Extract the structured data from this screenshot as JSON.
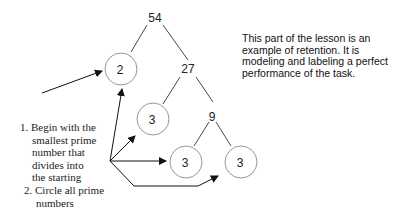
{
  "tree": {
    "root": "54",
    "nodes": [
      {
        "id": "n54",
        "label": "54",
        "circled": false
      },
      {
        "id": "n2",
        "label": "2",
        "circled": true
      },
      {
        "id": "n27",
        "label": "27",
        "circled": false
      },
      {
        "id": "n3a",
        "label": "3",
        "circled": true
      },
      {
        "id": "n9",
        "label": "9",
        "circled": false
      },
      {
        "id": "n3b",
        "label": "3",
        "circled": true
      },
      {
        "id": "n3c",
        "label": "3",
        "circled": true
      }
    ],
    "edges": [
      [
        "54",
        "2"
      ],
      [
        "54",
        "27"
      ],
      [
        "27",
        "3"
      ],
      [
        "27",
        "9"
      ],
      [
        "9",
        "3"
      ],
      [
        "9",
        "3"
      ]
    ]
  },
  "caption": {
    "lines": [
      "This part of the lesson is an",
      "example of retention.  It is",
      "modeling and labeling a perfect",
      "performance of the task."
    ]
  },
  "steps": {
    "step1": {
      "lines": [
        "1. Begin with the",
        "smallest prime",
        "number that",
        "divides into",
        "the starting",
        "."
      ]
    },
    "step2": {
      "lines": [
        "2. Circle all prime",
        "numbers"
      ]
    }
  },
  "colors": {
    "line": "#333333",
    "circle": "#8a8a8a",
    "text": "#222222"
  }
}
